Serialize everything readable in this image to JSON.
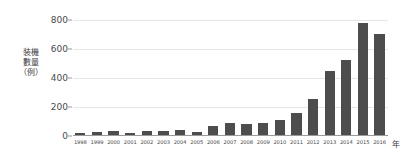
{
  "chart_data": {
    "type": "bar",
    "title": "",
    "subtitle": "",
    "xlabel": "年",
    "ylabel": "装機\n數量\n（例）",
    "ylabel_lines": [
      "装機",
      "數量",
      "（例）"
    ],
    "categories": [
      "1998",
      "1999",
      "2000",
      "2001",
      "2002",
      "2003",
      "2004",
      "2005",
      "2006",
      "2007",
      "2008",
      "2009",
      "2010",
      "2011",
      "2012",
      "2013",
      "2014",
      "2015",
      "2016"
    ],
    "values": [
      12,
      18,
      30,
      17,
      25,
      28,
      35,
      20,
      60,
      85,
      75,
      85,
      105,
      155,
      248,
      447,
      523,
      780,
      703
    ],
    "series": [
      {
        "name": "装機數量（例）",
        "values": [
          12,
          18,
          30,
          17,
          25,
          28,
          35,
          20,
          60,
          85,
          75,
          85,
          105,
          155,
          248,
          447,
          523,
          780,
          703
        ]
      }
    ],
    "ylim": [
      0,
      800
    ],
    "yticks": [
      0,
      200,
      400,
      600,
      800
    ],
    "ytick_labels": [
      "0",
      "200",
      "400",
      "600",
      "800"
    ],
    "grid": true,
    "legend": false,
    "legend_position": "none",
    "bar_color": "#4d4d4d",
    "grid_color": "#e6e6e6",
    "axis_color": "#9a9a9a",
    "text_color": "#4a4a4a",
    "background": "#ffffff"
  }
}
